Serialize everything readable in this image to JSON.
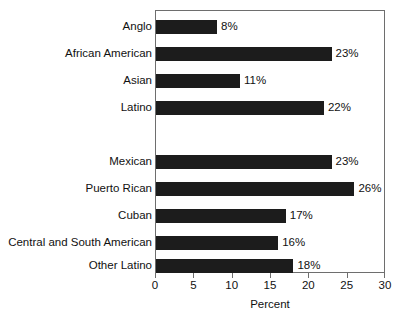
{
  "chart_data": {
    "type": "bar",
    "orientation": "horizontal",
    "title": "",
    "xlabel": "Percent",
    "ylabel": "",
    "xlim": [
      0,
      30
    ],
    "xticks": [
      0,
      5,
      10,
      15,
      20,
      25,
      30
    ],
    "xtick_labels": [
      "0",
      "5",
      "10",
      "15",
      "20",
      "25",
      "30"
    ],
    "grid": false,
    "legend": false,
    "bar_color": "#1c1c1c",
    "frame_color": "#6e6e6e",
    "value_suffix": "%",
    "groups": [
      {
        "name": "Race and ethnicity",
        "categories": [
          "Anglo",
          "African American",
          "Asian",
          "Latino"
        ],
        "values": [
          8,
          23,
          11,
          22
        ]
      },
      {
        "name": "Latino origin",
        "categories": [
          "Mexican",
          "Puerto Rican",
          "Cuban",
          "Central and South American",
          "Other Latino"
        ],
        "values": [
          23,
          26,
          17,
          16,
          18
        ]
      }
    ],
    "categories": [
      "Anglo",
      "African American",
      "Asian",
      "Latino",
      "Mexican",
      "Puerto Rican",
      "Cuban",
      "Central and South American",
      "Other Latino"
    ],
    "values": [
      8,
      23,
      11,
      22,
      23,
      26,
      17,
      16,
      18
    ],
    "data_labels": [
      "8%",
      "23%",
      "11%",
      "22%",
      "23%",
      "26%",
      "17%",
      "16%",
      "18%"
    ]
  },
  "rows": [
    {
      "label": "Anglo",
      "value": 8,
      "data_label": "8%",
      "top": 20,
      "spacer": false
    },
    {
      "label": "African American",
      "value": 23,
      "data_label": "23%",
      "top": 47,
      "spacer": false
    },
    {
      "label": "Asian",
      "value": 11,
      "data_label": "11%",
      "top": 74,
      "spacer": false
    },
    {
      "label": "Latino",
      "value": 22,
      "data_label": "22%",
      "top": 101,
      "spacer": false
    },
    {
      "label": "",
      "value": 0,
      "data_label": "",
      "top": 128,
      "spacer": true
    },
    {
      "label": "Mexican",
      "value": 23,
      "data_label": "23%",
      "top": 155,
      "spacer": false
    },
    {
      "label": "Puerto Rican",
      "value": 26,
      "data_label": "26%",
      "top": 182,
      "spacer": false
    },
    {
      "label": "Cuban",
      "value": 17,
      "data_label": "17%",
      "top": 209,
      "spacer": false
    },
    {
      "label": "Central and South American",
      "value": 16,
      "data_label": "16%",
      "top": 236,
      "spacer": false
    },
    {
      "label": "Other Latino",
      "value": 18,
      "data_label": "18%",
      "top": 259,
      "spacer": false
    }
  ],
  "axis": {
    "title": "Percent",
    "ticks": [
      "0",
      "5",
      "10",
      "15",
      "20",
      "25",
      "30"
    ]
  }
}
